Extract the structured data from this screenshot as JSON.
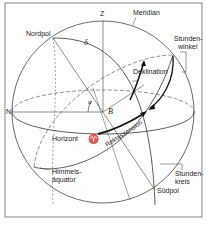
{
  "diagram": {
    "labels": {
      "zenith": "Z",
      "meridian": "Meridian",
      "nordpol": "Nordpol",
      "delta": "δ",
      "stundenwinkel_1": "Stunden-",
      "stundenwinkel_2": "winkel",
      "deklination": "Deklination",
      "north": "N",
      "phi": "φ",
      "observer": "B",
      "horizont": "Horizont",
      "aries": "♈",
      "rektaszension": "Rektaszension",
      "himmelsaequator_1": "Himmels-",
      "himmelsaequator_2": "äquator",
      "stundenkreis_1": "Stunden-",
      "stundenkreis_2": "kreis",
      "suedpol": "Südpol"
    },
    "colors": {
      "line": "#333333",
      "frame": "#777777",
      "background": "#ffffff"
    }
  }
}
